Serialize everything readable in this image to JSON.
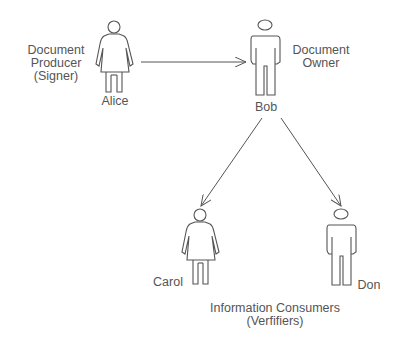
{
  "diagram": {
    "actors": [
      {
        "id": "alice",
        "name": "Alice",
        "gender": "female",
        "role": "Document Producer (Signer)"
      },
      {
        "id": "bob",
        "name": "Bob",
        "gender": "male",
        "role": "Document Owner"
      },
      {
        "id": "carol",
        "name": "Carol",
        "gender": "female",
        "role": "Information Consumer"
      },
      {
        "id": "don",
        "name": "Don",
        "gender": "male",
        "role": "Information Consumer"
      }
    ],
    "edges": [
      {
        "from": "alice",
        "to": "bob"
      },
      {
        "from": "bob",
        "to": "carol"
      },
      {
        "from": "bob",
        "to": "don"
      }
    ],
    "labels": {
      "producer_line1": "Document",
      "producer_line2": "Producer",
      "producer_line3": "(Signer)",
      "owner_line1": "Document",
      "owner_line2": "Owner",
      "consumers_line1": "Information Consumers",
      "consumers_line2": "(Verfifiers)"
    },
    "colors": {
      "stroke": "#555555",
      "text": "#555555",
      "background": "#ffffff"
    }
  }
}
